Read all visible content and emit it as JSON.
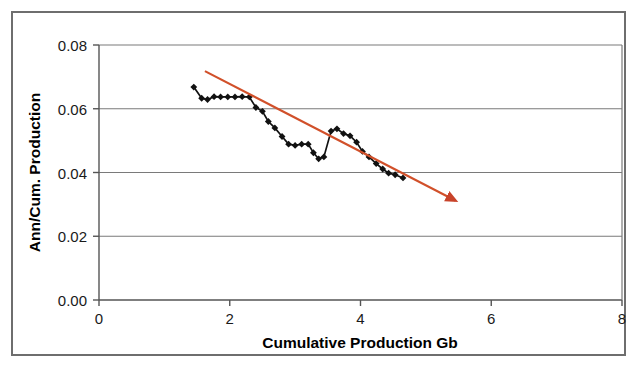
{
  "chart_data": {
    "type": "line",
    "title": "",
    "xlabel": "Cumulative Production Gb",
    "ylabel": "Ann/Cum. Production",
    "xlim": [
      0,
      8
    ],
    "ylim": [
      0.0,
      0.08
    ],
    "xticks": [
      0,
      2,
      4,
      6,
      8
    ],
    "yticks": [
      0.0,
      0.02,
      0.04,
      0.06,
      0.08
    ],
    "xtick_labels": [
      "0",
      "2",
      "4",
      "6",
      "8"
    ],
    "ytick_labels": [
      "0.00",
      "0.02",
      "0.04",
      "0.06",
      "0.08"
    ],
    "grid": "horizontal",
    "legend": "none",
    "series": [
      {
        "name": "Ann/Cum. Production",
        "type": "line",
        "color": "#111111",
        "marker": "diamond",
        "points": [
          [
            1.45,
            0.0668
          ],
          [
            1.57,
            0.0633
          ],
          [
            1.66,
            0.0629
          ],
          [
            1.76,
            0.0638
          ],
          [
            1.86,
            0.0637
          ],
          [
            1.97,
            0.0637
          ],
          [
            2.08,
            0.0637
          ],
          [
            2.19,
            0.0638
          ],
          [
            2.3,
            0.0637
          ],
          [
            2.4,
            0.0604
          ],
          [
            2.5,
            0.0592
          ],
          [
            2.59,
            0.056
          ],
          [
            2.69,
            0.054
          ],
          [
            2.8,
            0.0513
          ],
          [
            2.9,
            0.0489
          ],
          [
            3.0,
            0.0485
          ],
          [
            3.1,
            0.0489
          ],
          [
            3.2,
            0.0489
          ],
          [
            3.28,
            0.0462
          ],
          [
            3.36,
            0.0443
          ],
          [
            3.44,
            0.0449
          ],
          [
            3.55,
            0.053
          ],
          [
            3.64,
            0.0537
          ],
          [
            3.74,
            0.0522
          ],
          [
            3.84,
            0.0515
          ],
          [
            3.94,
            0.0495
          ],
          [
            4.03,
            0.0466
          ],
          [
            4.13,
            0.0449
          ],
          [
            4.24,
            0.0428
          ],
          [
            4.34,
            0.0411
          ],
          [
            4.43,
            0.0398
          ],
          [
            4.53,
            0.0393
          ],
          [
            4.65,
            0.0383
          ]
        ]
      },
      {
        "name": "trendline",
        "type": "line",
        "color": "#d1502a",
        "marker": "arrow-end",
        "points": [
          [
            1.62,
            0.0718
          ],
          [
            5.45,
            0.0312
          ]
        ]
      }
    ]
  },
  "axes": {
    "y_title": "Ann/Cum. Production",
    "x_title": "Cumulative Production Gb"
  }
}
